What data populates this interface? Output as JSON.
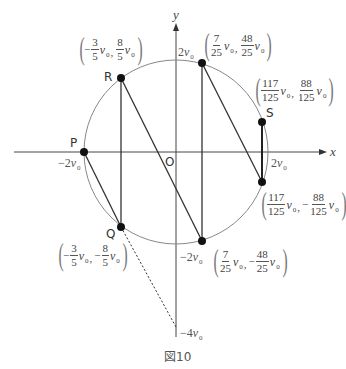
{
  "figure": {
    "caption": "図10",
    "x_axis_label": "x",
    "y_axis_label": "y",
    "origin_label": "O"
  },
  "notation": {
    "open": "(",
    "close": ")",
    "separator": ",",
    "var": "v",
    "sub": "0"
  },
  "ticks": {
    "y_top": {
      "coef": "2"
    },
    "x_left": {
      "coef": "−2"
    },
    "x_right": {
      "coef": "2"
    },
    "y_bottom": {
      "coef": "−2"
    },
    "y_lower_end": {
      "coef": "−4"
    }
  },
  "points": {
    "P": {
      "label": "P"
    },
    "R": {
      "label": "R",
      "x": {
        "sign": "−",
        "num": "3",
        "den": "5"
      },
      "y": {
        "sign": "",
        "num": "8",
        "den": "5"
      }
    },
    "T": {
      "x": {
        "sign": "",
        "num": "7",
        "den": "25"
      },
      "y": {
        "sign": "",
        "num": "48",
        "den": "25"
      }
    },
    "S": {
      "label": "S",
      "x": {
        "sign": "",
        "num": "117",
        "den": "125"
      },
      "y": {
        "sign": "",
        "num": "88",
        "den": "125"
      }
    },
    "S2": {
      "x": {
        "sign": "",
        "num": "117",
        "den": "125"
      },
      "y": {
        "sign": "−",
        "num": "88",
        "den": "125"
      }
    },
    "B": {
      "x": {
        "sign": "",
        "num": "7",
        "den": "25"
      },
      "y": {
        "sign": "−",
        "num": "48",
        "den": "25"
      }
    },
    "Q": {
      "label": "Q",
      "x": {
        "sign": "−",
        "num": "3",
        "den": "5"
      },
      "y": {
        "sign": "−",
        "num": "8",
        "den": "5"
      }
    }
  }
}
